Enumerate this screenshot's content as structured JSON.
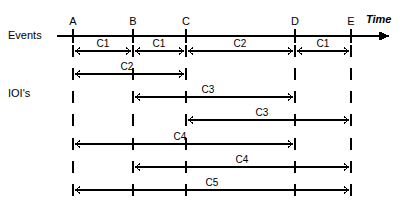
{
  "diagram": {
    "title_labels": {
      "events_row": "Events",
      "ioi_rows": "IOI's",
      "time_axis": "Time"
    },
    "events": [
      {
        "name": "A",
        "x": 73
      },
      {
        "name": "B",
        "x": 133
      },
      {
        "name": "C",
        "x": 186
      },
      {
        "name": "D",
        "x": 295
      },
      {
        "name": "E",
        "x": 351
      }
    ],
    "axis": {
      "start_x": 57,
      "end_x": 390,
      "y": 36,
      "arrow": "right-arrow"
    },
    "intervals": [
      {
        "row": 1,
        "y": 51,
        "label": "C1",
        "from": "A",
        "to": "B",
        "interior_ticks": [],
        "label_x": 103
      },
      {
        "row": 1,
        "y": 51,
        "label": "C1",
        "from": "B",
        "to": "C",
        "interior_ticks": [],
        "label_x": 159
      },
      {
        "row": 1,
        "y": 51,
        "label": "C2",
        "from": "C",
        "to": "D",
        "interior_ticks": [],
        "label_x": 240
      },
      {
        "row": 1,
        "y": 51,
        "label": "C1",
        "from": "D",
        "to": "E",
        "interior_ticks": [],
        "label_x": 323
      },
      {
        "row": 2,
        "y": 74,
        "label": "C2",
        "from": "A",
        "to": "C",
        "interior_ticks": [
          "B"
        ],
        "label_x": 127,
        "lone_ticks": [
          "D",
          "E"
        ]
      },
      {
        "row": 3,
        "y": 97,
        "label": "C3",
        "from": "B",
        "to": "D",
        "interior_ticks": [
          "C"
        ],
        "label_x": 208,
        "lone_ticks": [
          "A",
          "E"
        ]
      },
      {
        "row": 4,
        "y": 120,
        "label": "C3",
        "from": "C",
        "to": "E",
        "interior_ticks": [
          "D"
        ],
        "label_x": 262,
        "lone_ticks": [
          "A",
          "B"
        ]
      },
      {
        "row": 5,
        "y": 144,
        "label": "C4",
        "from": "A",
        "to": "D",
        "interior_ticks": [
          "B",
          "C"
        ],
        "label_x": 180,
        "lone_ticks": [
          "E"
        ]
      },
      {
        "row": 6,
        "y": 167,
        "label": "C4",
        "from": "B",
        "to": "E",
        "interior_ticks": [
          "C",
          "D"
        ],
        "label_x": 242,
        "lone_ticks": [
          "A"
        ]
      },
      {
        "row": 7,
        "y": 190,
        "label": "C5",
        "from": "A",
        "to": "E",
        "interior_ticks": [
          "B",
          "C",
          "D"
        ],
        "label_x": 212,
        "lone_ticks": []
      }
    ],
    "colors": {
      "stroke": "#000000",
      "background": "#ffffff"
    }
  }
}
